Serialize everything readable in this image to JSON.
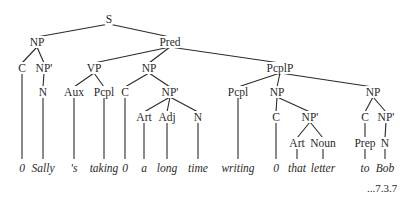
{
  "diagram": {
    "type": "syntax-tree",
    "reference": "...7.3.7",
    "nodes": [
      {
        "id": "S",
        "label": "S",
        "x": 109,
        "y": 19
      },
      {
        "id": "NP1",
        "label": "NP",
        "x": 37,
        "y": 42
      },
      {
        "id": "Pred",
        "label": "Pred",
        "x": 170,
        "y": 42
      },
      {
        "id": "C1",
        "label": "C",
        "x": 22,
        "y": 68
      },
      {
        "id": "NPp1",
        "label": "NP'",
        "x": 44,
        "y": 68
      },
      {
        "id": "VP",
        "label": "VP",
        "x": 94,
        "y": 68
      },
      {
        "id": "NP2",
        "label": "NP",
        "x": 149,
        "y": 68
      },
      {
        "id": "PcplP",
        "label": "PcplP",
        "x": 280,
        "y": 68
      },
      {
        "id": "N1",
        "label": "N",
        "x": 43,
        "y": 92
      },
      {
        "id": "Aux",
        "label": "Aux",
        "x": 74,
        "y": 92
      },
      {
        "id": "Pcpl1",
        "label": "Pcpl",
        "x": 104,
        "y": 92
      },
      {
        "id": "C2",
        "label": "C",
        "x": 125,
        "y": 92
      },
      {
        "id": "NPp2",
        "label": "NP'",
        "x": 170,
        "y": 92
      },
      {
        "id": "Pcpl2",
        "label": "Pcpl",
        "x": 238,
        "y": 92
      },
      {
        "id": "NP3",
        "label": "NP",
        "x": 277,
        "y": 92
      },
      {
        "id": "NP4",
        "label": "NP",
        "x": 373,
        "y": 92
      },
      {
        "id": "Art1",
        "label": "Art",
        "x": 144,
        "y": 117
      },
      {
        "id": "Adj",
        "label": "Adj",
        "x": 167,
        "y": 117
      },
      {
        "id": "N2",
        "label": "N",
        "x": 198,
        "y": 117
      },
      {
        "id": "C3",
        "label": "C",
        "x": 276,
        "y": 117
      },
      {
        "id": "NPp3",
        "label": "NP'",
        "x": 310,
        "y": 117
      },
      {
        "id": "C4",
        "label": "C",
        "x": 365,
        "y": 117
      },
      {
        "id": "NPp4",
        "label": "NP'",
        "x": 386,
        "y": 117
      },
      {
        "id": "Art2",
        "label": "Art",
        "x": 297,
        "y": 143
      },
      {
        "id": "Noun",
        "label": "Noun",
        "x": 323,
        "y": 143
      },
      {
        "id": "Prep",
        "label": "Prep",
        "x": 365,
        "y": 143
      },
      {
        "id": "N3",
        "label": "N",
        "x": 385,
        "y": 143
      }
    ],
    "leaves": [
      {
        "id": "w1",
        "label": "0",
        "x": 22,
        "y": 168,
        "parent": "C1"
      },
      {
        "id": "w2",
        "label": "Sally",
        "x": 43,
        "y": 168,
        "parent": "N1"
      },
      {
        "id": "w3",
        "label": "'s",
        "x": 74,
        "y": 168,
        "parent": "Aux"
      },
      {
        "id": "w4",
        "label": "taking",
        "x": 104,
        "y": 168,
        "parent": "Pcpl1"
      },
      {
        "id": "w5",
        "label": "0",
        "x": 125,
        "y": 168,
        "parent": "C2"
      },
      {
        "id": "w6",
        "label": "a",
        "x": 144,
        "y": 168,
        "parent": "Art1"
      },
      {
        "id": "w7",
        "label": "long",
        "x": 167,
        "y": 168,
        "parent": "Adj"
      },
      {
        "id": "w8",
        "label": "time",
        "x": 198,
        "y": 168,
        "parent": "N2"
      },
      {
        "id": "w9",
        "label": "writing",
        "x": 238,
        "y": 168,
        "parent": "Pcpl2"
      },
      {
        "id": "w10",
        "label": "0",
        "x": 276,
        "y": 168,
        "parent": "C3"
      },
      {
        "id": "w11",
        "label": "that",
        "x": 297,
        "y": 168,
        "parent": "Art2"
      },
      {
        "id": "w12",
        "label": "letter",
        "x": 323,
        "y": 168,
        "parent": "Noun"
      },
      {
        "id": "w13",
        "label": "to",
        "x": 365,
        "y": 168,
        "parent": "Prep"
      },
      {
        "id": "w14",
        "label": "Bob",
        "x": 385,
        "y": 168,
        "parent": "N3"
      }
    ],
    "edges": [
      [
        "S",
        "NP1"
      ],
      [
        "S",
        "Pred"
      ],
      [
        "NP1",
        "C1"
      ],
      [
        "NP1",
        "NPp1"
      ],
      [
        "Pred",
        "VP"
      ],
      [
        "Pred",
        "NP2"
      ],
      [
        "Pred",
        "PcplP"
      ],
      [
        "NPp1",
        "N1"
      ],
      [
        "VP",
        "Aux"
      ],
      [
        "VP",
        "Pcpl1"
      ],
      [
        "NP2",
        "C2"
      ],
      [
        "NP2",
        "NPp2"
      ],
      [
        "NPp2",
        "Art1"
      ],
      [
        "NPp2",
        "Adj"
      ],
      [
        "NPp2",
        "N2"
      ],
      [
        "PcplP",
        "Pcpl2"
      ],
      [
        "PcplP",
        "NP3"
      ],
      [
        "PcplP",
        "NP4"
      ],
      [
        "NP3",
        "C3"
      ],
      [
        "NP3",
        "NPp3"
      ],
      [
        "NPp3",
        "Art2"
      ],
      [
        "NPp3",
        "Noun"
      ],
      [
        "NP4",
        "C4"
      ],
      [
        "NP4",
        "NPp4"
      ],
      [
        "C4",
        "Prep"
      ],
      [
        "NPp4",
        "N3"
      ]
    ]
  }
}
